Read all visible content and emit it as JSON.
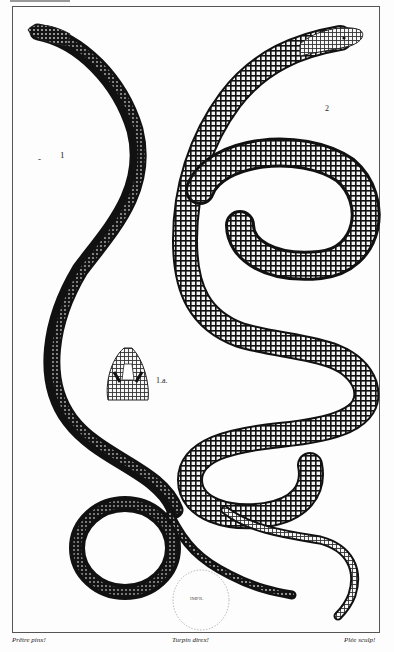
{
  "plate": {
    "subject": "Engraved natural-history plate of two legless lizards (glass snakes)",
    "background_color": "#fdfdfd",
    "ink_color": "#111111"
  },
  "figures": [
    {
      "id": "fig-1",
      "label": "1",
      "description": "Dark-backed legless lizard, S-curved body ending in a coil"
    },
    {
      "id": "fig-1a",
      "label": "1.a.",
      "description": "Detail of head scales, dorsal view"
    },
    {
      "id": "fig-2",
      "label": "2",
      "description": "Lighter cross-hatched legless lizard coiled in loops"
    }
  ],
  "credits": {
    "left": "Prêtre pinx!",
    "center": "Turpin direx!",
    "right": "Plée sculp!"
  },
  "stamp": {
    "top_text": "BIBLIOTH. NATION.",
    "center_text": "IMPR."
  }
}
